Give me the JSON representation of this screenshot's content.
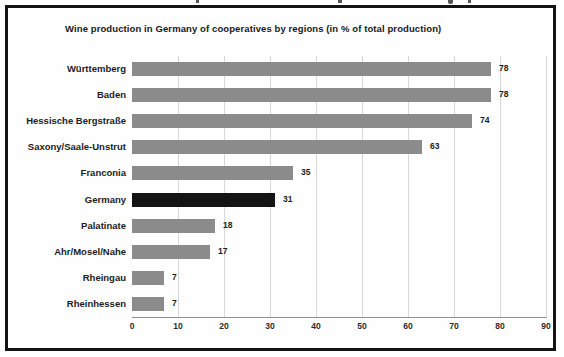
{
  "title": "Wine production in Germany of cooperatives by regions (in % of total production)",
  "colors": {
    "bar": "#8b8b8b",
    "highlight_bar": "#141414",
    "gridline": "#d8d8d8",
    "axis": "#8f8f8f",
    "frame_border": "#141414",
    "background": "#ffffff",
    "text": "#1c1c1c"
  },
  "chart_data": {
    "type": "bar",
    "orientation": "horizontal",
    "title": "Wine production in Germany of cooperatives by regions (in % of total production)",
    "categories": [
      "Württemberg",
      "Baden",
      "Hessische Bergstraße",
      "Saxony/Saale-Unstrut",
      "Franconia",
      "Germany",
      "Palatinate",
      "Ahr/Mosel/Nahe",
      "Rheingau",
      "Rheinhessen"
    ],
    "values": [
      78,
      78,
      74,
      63,
      35,
      31,
      18,
      17,
      7,
      7
    ],
    "value_labels": [
      "78",
      "78",
      "74",
      "63",
      "35",
      "31",
      "18",
      "17",
      "7",
      "7"
    ],
    "highlighted_category": "Germany",
    "xlabel": "",
    "ylabel": "",
    "xlim": [
      0,
      90
    ],
    "xticks": [
      0,
      10,
      20,
      30,
      40,
      50,
      60,
      70,
      80,
      90
    ],
    "grid": true,
    "legend": false
  }
}
